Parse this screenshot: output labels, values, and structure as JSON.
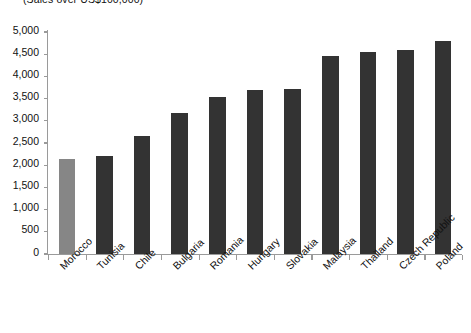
{
  "chart_data": {
    "type": "bar",
    "title": "(Sales over US$100,000)",
    "xlabel": "",
    "ylabel": "",
    "ylim": [
      0,
      5000
    ],
    "ytick_step": 500,
    "grid": false,
    "legend": null,
    "categories": [
      "Morocco",
      "Tunisia",
      "Chile",
      "Bulgaria",
      "Romania",
      "Hungary",
      "Slovakia",
      "Malaysia",
      "Thailand",
      "Czech Republic",
      "Poland"
    ],
    "values": [
      2130,
      2210,
      2650,
      3170,
      3530,
      3700,
      3720,
      4460,
      4540,
      4600,
      4800
    ],
    "ytick_labels": [
      "0",
      "500",
      "1,000",
      "1,500",
      "2,000",
      "2,500",
      "3,000",
      "3,500",
      "4,000",
      "4,500",
      "5,000"
    ],
    "ytick_values": [
      0,
      500,
      1000,
      1500,
      2000,
      2500,
      3000,
      3500,
      4000,
      4500,
      5000
    ],
    "bar_colors": [
      "#868686",
      "#333333",
      "#333333",
      "#333333",
      "#333333",
      "#333333",
      "#333333",
      "#333333",
      "#333333",
      "#333333",
      "#333333"
    ],
    "highlight_category": "Morocco",
    "accent_color": "#333333",
    "highlight_color": "#868686",
    "axis_color": "#9a9a9a",
    "background_color": "#ffffff"
  }
}
